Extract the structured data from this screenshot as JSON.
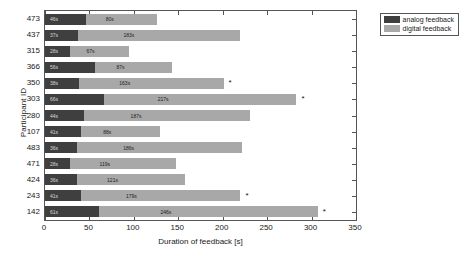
{
  "chart_data": {
    "type": "bar",
    "orientation": "horizontal",
    "stacked": true,
    "title": "",
    "xlabel": "Duration of feedback [s]",
    "ylabel": "Participant ID",
    "xlim": [
      0,
      350
    ],
    "xticks": [
      0,
      50,
      100,
      150,
      200,
      250,
      300,
      350
    ],
    "grid": false,
    "legend_position": "top-right",
    "categories": [
      "473",
      "437",
      "315",
      "366",
      "350",
      "303",
      "280",
      "107",
      "483",
      "471",
      "424",
      "243",
      "142"
    ],
    "series": [
      {
        "name": "analog feedback",
        "color": "#3f3f3f",
        "values": [
          46,
          37,
          28,
          56,
          38,
          66,
          44,
          41,
          36,
          28,
          36,
          41,
          61
        ],
        "labels": [
          "46s",
          "37s",
          "28s",
          "56s",
          "38s",
          "66s",
          "44s",
          "41s",
          "36s",
          "28s",
          "36s",
          "41s",
          "61s"
        ]
      },
      {
        "name": "digital feedback",
        "color": "#a8a8a8",
        "values": [
          80,
          183,
          67,
          87,
          163,
          217,
          187,
          88,
          186,
          119,
          121,
          179,
          246
        ],
        "labels": [
          "80s",
          "183s",
          "67s",
          "87s",
          "163s",
          "217s",
          "187s",
          "88s",
          "186s",
          "119s",
          "121s",
          "179s",
          "246s"
        ]
      }
    ],
    "totals": [
      126,
      220,
      95,
      143,
      201,
      283,
      231,
      129,
      222,
      147,
      157,
      220,
      307
    ],
    "annotations": [
      {
        "category": "350",
        "marker": "*"
      },
      {
        "category": "303",
        "marker": "*"
      },
      {
        "category": "243",
        "marker": "*"
      },
      {
        "category": "142",
        "marker": "*"
      }
    ]
  },
  "legend": {
    "items": [
      {
        "label": "analog feedback"
      },
      {
        "label": "digital feedback"
      }
    ]
  }
}
